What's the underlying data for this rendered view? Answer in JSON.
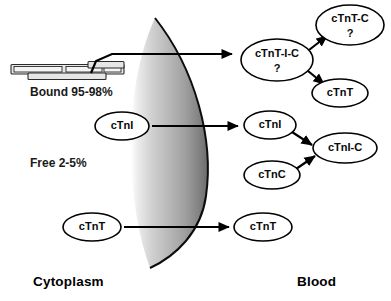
{
  "figure": {
    "regions": {
      "left_label": "Cytoplasm",
      "right_label": "Blood"
    },
    "pools": {
      "bound": "Bound 95-98%",
      "free": "Free 2-5%"
    }
  },
  "nodes": {
    "cytoplasm": [
      {
        "id": "cyt-ctni",
        "label": "cTnI",
        "sub": "",
        "cx": 122,
        "cy": 126,
        "rx": 27,
        "ry": 14,
        "fontSize": 11
      },
      {
        "id": "cyt-ctnt",
        "label": "cTnT",
        "sub": "",
        "cx": 92,
        "cy": 227,
        "rx": 29,
        "ry": 14,
        "fontSize": 11
      }
    ],
    "blood": [
      {
        "id": "blood-ctnt-i-c",
        "label": "cTnT-I-C",
        "sub": "?",
        "cx": 277,
        "cy": 60,
        "rx": 36,
        "ry": 21,
        "fontSize": 11
      },
      {
        "id": "blood-ctnt-c",
        "label": "cTnT-C",
        "sub": "?",
        "cx": 350,
        "cy": 25,
        "rx": 34,
        "ry": 20,
        "fontSize": 11
      },
      {
        "id": "blood-ctnt-top",
        "label": "cTnT",
        "sub": "",
        "cx": 340,
        "cy": 93,
        "rx": 28,
        "ry": 14,
        "fontSize": 11
      },
      {
        "id": "blood-ctni",
        "label": "cTnI",
        "sub": "",
        "cx": 270,
        "cy": 125,
        "rx": 26,
        "ry": 14,
        "fontSize": 11
      },
      {
        "id": "blood-ctni-c",
        "label": "cTnI-C",
        "sub": "",
        "cx": 345,
        "cy": 148,
        "rx": 32,
        "ry": 15,
        "fontSize": 11
      },
      {
        "id": "blood-ctnc",
        "label": "cTnC",
        "sub": "",
        "cx": 272,
        "cy": 175,
        "rx": 28,
        "ry": 14,
        "fontSize": 11
      },
      {
        "id": "blood-ctnt-bottom",
        "label": "cTnT",
        "sub": "",
        "cx": 263,
        "cy": 227,
        "rx": 29,
        "ry": 14,
        "fontSize": 11
      }
    ]
  },
  "colors": {
    "stroke": "#000000",
    "membrane_light": "#f2f2f2",
    "membrane_mid": "#b5b5b5",
    "membrane_dark": "#6e6e6e",
    "filament_fill": "#e6e6e6",
    "text": "#0a0a0a",
    "background": "#ffffff"
  }
}
